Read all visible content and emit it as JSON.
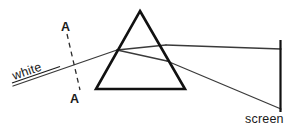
{
  "figure": {
    "labels": {
      "incident_ray": "white",
      "wavefront_top": "A",
      "wavefront_bottom": "A",
      "screen": "screen"
    },
    "colors": {
      "background": "#ffffff",
      "prism_stroke": "#111111",
      "ray_stroke": "#3a3a3a",
      "dashed_stroke": "#2b2b2b",
      "screen_stroke": "#111111",
      "text": "#1a1a1a"
    },
    "geometry": {
      "prism": {
        "shape": "triangle",
        "apex": [
          140,
          11
        ],
        "bottom_left": [
          96,
          89
        ],
        "bottom_right": [
          185,
          89
        ],
        "stroke_width": 2.6
      },
      "incident_ray": {
        "from": [
          13,
          86
        ],
        "to": [
          117,
          50
        ],
        "stroke_width": 1.3
      },
      "internal_rays": [
        {
          "from": [
            117,
            50
          ],
          "to": [
            166,
            45
          ],
          "stroke_width": 1.3
        },
        {
          "from": [
            117,
            50
          ],
          "to": [
            167,
            61
          ],
          "stroke_width": 1.3
        }
      ],
      "emergent_rays": [
        {
          "from": [
            166,
            45
          ],
          "to": [
            280,
            49
          ],
          "stroke_width": 1.3
        },
        {
          "from": [
            167,
            61
          ],
          "to": [
            280,
            109
          ],
          "stroke_width": 1.3
        }
      ],
      "wavefront_dashed": {
        "from": [
          67,
          34
        ],
        "to": [
          80,
          90
        ],
        "dash_pattern": "5 4",
        "stroke_width": 1.3
      },
      "screen": {
        "from": [
          280,
          40
        ],
        "to": [
          280,
          112
        ],
        "stroke_width": 2.2
      },
      "white_label": {
        "x": 14,
        "y": 80,
        "rotation_deg": -19,
        "underline": {
          "x1": 12,
          "y1": 83,
          "x2": 60,
          "y2": 66
        }
      },
      "a_top_label": {
        "x": 61,
        "y": 31
      },
      "a_bottom_label": {
        "x": 70,
        "y": 103
      },
      "screen_label": {
        "x": 246,
        "y": 123
      }
    }
  }
}
